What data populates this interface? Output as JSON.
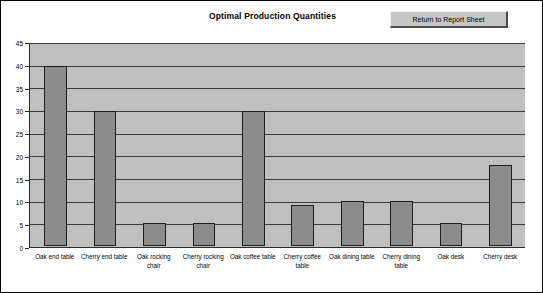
{
  "chart": {
    "title": "Optimal Production Quantities"
  },
  "button": {
    "label": "Return to Report Sheet"
  },
  "chart_data": {
    "type": "bar",
    "title": "Optimal Production Quantities",
    "xlabel": "",
    "ylabel": "",
    "ylim": [
      0,
      45
    ],
    "ytick_step": 5,
    "yticks": [
      0,
      5,
      10,
      15,
      20,
      25,
      30,
      35,
      40,
      45
    ],
    "grid": true,
    "legend": "none",
    "plot_background": "#bfbfbf",
    "bar_color": "#8c8c8c",
    "bar_border_color": "#1e1e1e",
    "categories": [
      "Oak end table",
      "Cherry end table",
      "Oak rocking chair",
      "Cherry rocking chair",
      "Oak coffee table",
      "Cherry coffee table",
      "Oak dining table",
      "Cherry dining table",
      "Oak desk",
      "Cherry desk"
    ],
    "values": [
      40,
      30,
      5,
      5,
      30,
      9,
      10,
      10,
      5,
      18
    ]
  }
}
